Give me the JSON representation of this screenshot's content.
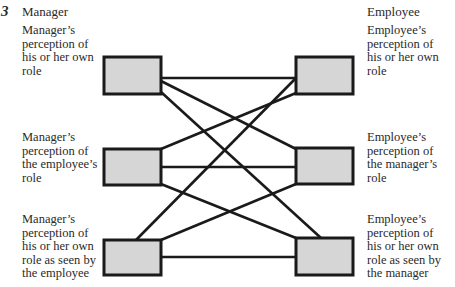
{
  "figure": {
    "number": "3",
    "left_heading": "Manager",
    "right_heading": "Employee",
    "left_labels": [
      [
        "Manager’s",
        "perception of",
        "his or her own",
        "role"
      ],
      [
        "Manager’s",
        "perception of",
        "the employee’s",
        "role"
      ],
      [
        "Manager’s",
        "perception of",
        "his or her own",
        "role as seen by",
        "the employee"
      ]
    ],
    "right_labels": [
      [
        "Employee’s",
        "perception of",
        "his or her own",
        "role"
      ],
      [
        "Employee’s",
        "perception of",
        "the manager’s",
        "role"
      ],
      [
        "Employee’s",
        "perception of",
        "his or her own",
        "role as seen by",
        "the manager"
      ]
    ]
  },
  "colors": {
    "box_fill": "#d6d6d6",
    "stroke": "#1a1a1a",
    "text": "#2a2a2a"
  },
  "nodes": [
    {
      "id": "L1",
      "x": 104,
      "y": 57,
      "w": 57,
      "h": 37
    },
    {
      "id": "L2",
      "x": 104,
      "y": 149,
      "w": 57,
      "h": 36
    },
    {
      "id": "L3",
      "x": 104,
      "y": 240,
      "w": 57,
      "h": 35
    },
    {
      "id": "R1",
      "x": 296,
      "y": 57,
      "w": 57,
      "h": 37
    },
    {
      "id": "R2",
      "x": 296,
      "y": 148,
      "w": 57,
      "h": 36
    },
    {
      "id": "R3",
      "x": 296,
      "y": 238,
      "w": 57,
      "h": 37
    }
  ],
  "edges": [
    {
      "from": "L1",
      "to": "R1",
      "x1": 161,
      "y1": 78,
      "x2": 296,
      "y2": 78
    },
    {
      "from": "L1",
      "to": "R2",
      "x1": 161,
      "y1": 81,
      "x2": 296,
      "y2": 149
    },
    {
      "from": "L1",
      "to": "R3",
      "x1": 161,
      "y1": 92,
      "x2": 321,
      "y2": 238
    },
    {
      "from": "R1",
      "to": "L3",
      "x1": 296,
      "y1": 78,
      "x2": 136,
      "y2": 240
    },
    {
      "from": "R1",
      "to": "L2",
      "x1": 296,
      "y1": 93,
      "x2": 161,
      "y2": 149
    },
    {
      "from": "L2",
      "to": "R2",
      "x1": 161,
      "y1": 167,
      "x2": 296,
      "y2": 167
    },
    {
      "from": "L2",
      "to": "R3",
      "x1": 161,
      "y1": 184,
      "x2": 296,
      "y2": 238
    },
    {
      "from": "R2",
      "to": "L3",
      "x1": 296,
      "y1": 184,
      "x2": 161,
      "y2": 240
    },
    {
      "from": "L3",
      "to": "R3",
      "x1": 161,
      "y1": 257,
      "x2": 296,
      "y2": 257
    }
  ]
}
